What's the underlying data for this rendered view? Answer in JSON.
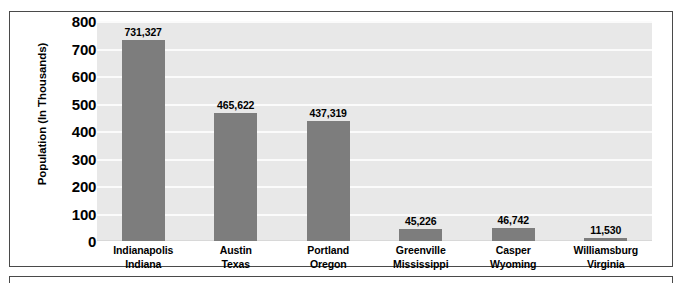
{
  "chart_data": {
    "type": "bar",
    "title": "",
    "xlabel": "",
    "ylabel": "Population (In Thousands)",
    "ylim": [
      0,
      800
    ],
    "yticks": [
      "800",
      "700",
      "600",
      "500",
      "400",
      "300",
      "200",
      "100",
      "0"
    ],
    "grid": true,
    "legend": "none",
    "categories": [
      "Indianapolis\nIndiana",
      "Austin\nTexas",
      "Portland\nOregon",
      "Greenville\nMississippi",
      "Casper\nWyoming",
      "Williamsburg\nVirginia"
    ],
    "category_lines": [
      {
        "city": "Indianapolis",
        "state": "Indiana"
      },
      {
        "city": "Austin",
        "state": "Texas"
      },
      {
        "city": "Portland",
        "state": "Oregon"
      },
      {
        "city": "Greenville",
        "state": "Mississippi"
      },
      {
        "city": "Casper",
        "state": "Wyoming"
      },
      {
        "city": "Williamsburg",
        "state": "Virginia"
      }
    ],
    "values": [
      731.327,
      465.622,
      437.319,
      45.226,
      46.742,
      11.53
    ],
    "value_labels": [
      "731,327",
      "465,622",
      "437,319",
      "45,226",
      "46,742",
      "11,530"
    ],
    "bar_color": "#7d7d7d",
    "plot_background": "#e8e8e8",
    "gridline_color": "#fbfbfb"
  }
}
